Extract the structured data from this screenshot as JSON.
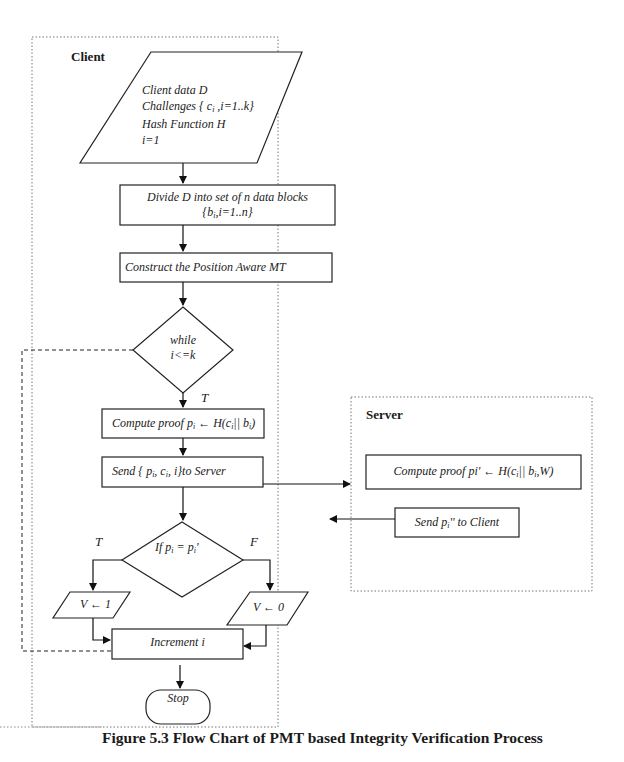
{
  "figure": {
    "caption": "Figure 5.3 Flow Chart of PMT based Integrity Verification Process"
  },
  "client": {
    "title": "Client",
    "input_block": {
      "line1": "Client data D",
      "line2": "Challenges { ci ,i=1..k}",
      "line3": "Hash Function H",
      "line4": "i=1"
    },
    "divide_block": {
      "line1": "Divide D into set of n data blocks",
      "line2": "{bi,i=1..n}"
    },
    "construct_block": "Construct the Position Aware MT",
    "while_decision": {
      "line1": "while",
      "line2": "i<=k",
      "true_label": "T"
    },
    "compute_block": "Compute proof pi ← H(ci|| bi)",
    "send_block": "Send { pi, ci, i}to Server",
    "if_decision": {
      "label": "If pi = pi'",
      "true_label": "T",
      "false_label": "F"
    },
    "v_true": "V ← 1",
    "v_false": "V ← 0",
    "increment_block": "Increment i",
    "stop": "Stop"
  },
  "server": {
    "title": "Server",
    "compute_block": "Compute proof pi' ← H(ci|| bi,W)",
    "send_block": "Send pi'' to Client"
  }
}
